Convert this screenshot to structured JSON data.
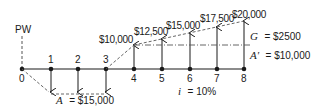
{
  "diagram": {
    "present_worth_label": "PW",
    "interest_label": "i = 10%",
    "interest_var": "i",
    "interest_value": "= 10%",
    "periods": [
      "0",
      "1",
      "2",
      "3",
      "4",
      "5",
      "6",
      "7",
      "8"
    ],
    "annuity": {
      "var": "A",
      "value": "= $15,000",
      "periods": [
        1,
        2,
        3
      ],
      "direction": "down"
    },
    "gradient_series": {
      "periods": [
        4,
        5,
        6,
        7,
        8
      ],
      "values": [
        "$10,000",
        "$12,500",
        "$15,000",
        "$17,500",
        "$20,000"
      ],
      "direction": "up"
    },
    "gradient_label": {
      "var": "G",
      "value": "= $2500"
    },
    "base_label": {
      "var": "A'",
      "value": "= $10,000"
    }
  },
  "colors": {
    "line": "#1a1a1a",
    "dash": "#555555",
    "background": "#ffffff"
  }
}
